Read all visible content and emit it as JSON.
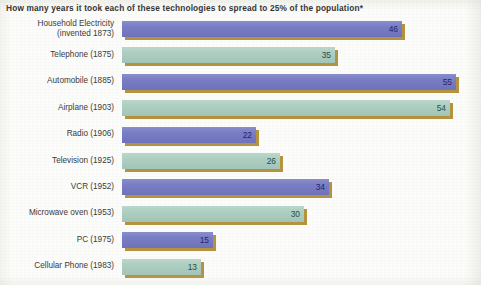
{
  "chart_data": {
    "type": "bar",
    "orientation": "horizontal",
    "title": "How many years it took each of these technologies to spread to 25% of the population*",
    "xlabel": "",
    "ylabel": "",
    "xlim": [
      0,
      58
    ],
    "grid": false,
    "legend": null,
    "value_unit": "years",
    "categories": [
      "Household Electricity\n(invented 1873)",
      "Telephone (1875)",
      "Automobile (1885)",
      "Airplane (1903)",
      "Radio (1906)",
      "Television (1925)",
      "VCR (1952)",
      "Microwave oven (1953)",
      "PC (1975)",
      "Cellular Phone (1983)"
    ],
    "values": [
      46,
      35,
      55,
      54,
      22,
      26,
      34,
      30,
      15,
      13
    ],
    "value_labels": [
      "46",
      "35",
      "55",
      "54",
      "22",
      "26",
      "34",
      "30",
      "15",
      "13"
    ],
    "bar_colors": [
      "#7478c4",
      "#a9cdbf",
      "#7478c4",
      "#a9cdbf",
      "#7478c4",
      "#a9cdbf",
      "#7478c4",
      "#a9cdbf",
      "#7478c4",
      "#a9cdbf"
    ],
    "shadow_color": "#b4933e",
    "background_color": "#fcfcfa",
    "title_color": "#2b2b2b",
    "label_color": "#3a3a3a",
    "value_color_blue": "#23246b",
    "value_color_green": "#1f4f45"
  },
  "footnote_marker": "*"
}
